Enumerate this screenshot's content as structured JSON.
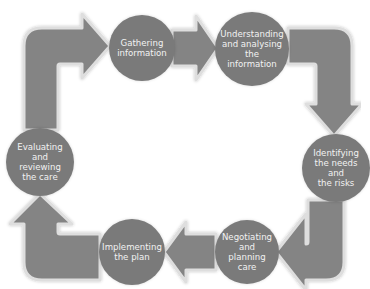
{
  "diagram": {
    "type": "cycle",
    "colors": {
      "node_fill": "#7a7a7a",
      "arrow_fill": "#848484",
      "arrow_outline": "#dcdcdc",
      "text": "#f2f2f2",
      "background": "#ffffff"
    },
    "nodes": [
      {
        "id": "gathering",
        "label": "Gathering information",
        "lines": [
          "Gathering",
          "information"
        ]
      },
      {
        "id": "understanding",
        "label": "Understanding and analysing the information",
        "lines": [
          "Understanding",
          "and analysing",
          "the information"
        ]
      },
      {
        "id": "identifying",
        "label": "Identifying the needs and the risks",
        "lines": [
          "Identifying",
          "the needs and",
          "the risks"
        ]
      },
      {
        "id": "negotiating",
        "label": "Negotiating and planning care",
        "lines": [
          "Negotiating",
          "and planning",
          "care"
        ]
      },
      {
        "id": "implementing",
        "label": "Implementing the plan",
        "lines": [
          "Implementing",
          "the plan"
        ]
      },
      {
        "id": "evaluating",
        "label": "Evaluating and reviewing the care",
        "lines": [
          "Evaluating",
          "and reviewing",
          "the care"
        ]
      }
    ],
    "edges": [
      {
        "from": "evaluating",
        "to": "gathering",
        "shape": "bent-arrow"
      },
      {
        "from": "gathering",
        "to": "understanding",
        "shape": "straight-arrow"
      },
      {
        "from": "understanding",
        "to": "identifying",
        "shape": "bent-arrow"
      },
      {
        "from": "identifying",
        "to": "negotiating",
        "shape": "bent-arrow"
      },
      {
        "from": "negotiating",
        "to": "implementing",
        "shape": "straight-arrow"
      },
      {
        "from": "implementing",
        "to": "evaluating",
        "shape": "bent-arrow"
      }
    ]
  }
}
